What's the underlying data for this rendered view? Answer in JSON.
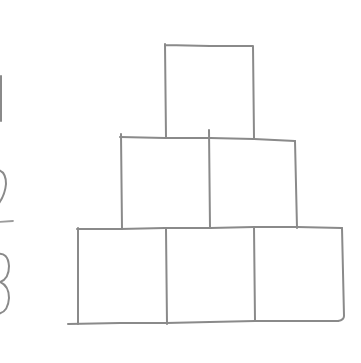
{
  "diagram": {
    "stroke_color": "#8a8a8a",
    "background": "#ffffff",
    "rows": [
      {
        "label": "1",
        "block_count": 1
      },
      {
        "label": "2",
        "block_count": 2
      },
      {
        "label": "3",
        "block_count": 3
      }
    ],
    "total_blocks": 6
  }
}
